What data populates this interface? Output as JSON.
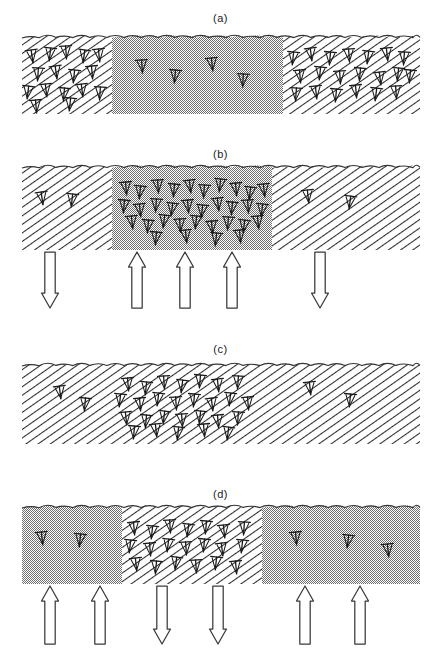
{
  "figure": {
    "width": 441,
    "height": 669,
    "caption": "",
    "colors": {
      "ink": "#1a1a1a",
      "hatch_line": "#2b2b2b",
      "stipple_gray": "#a8a8a8",
      "surface_line": "#333333",
      "arrow_outline": "#3a3a3a",
      "background": "#ffffff"
    }
  },
  "panels": [
    {
      "id": "a",
      "label": "(a)",
      "label_y": 12,
      "slab": {
        "x": 22,
        "y": 38,
        "width": 398,
        "height": 76
      },
      "regions": [
        {
          "name": "left-region",
          "fill": "hatch",
          "x0": 22,
          "x1": 112,
          "dislocation_density": "high"
        },
        {
          "name": "center-region",
          "fill": "stipple",
          "x0": 112,
          "x1": 283,
          "dislocation_density": "low"
        },
        {
          "name": "right-region",
          "fill": "hatch",
          "x0": 283,
          "x1": 420,
          "dislocation_density": "high"
        }
      ],
      "dislocations": [
        {
          "x": 32,
          "y": 56,
          "r": -8
        },
        {
          "x": 50,
          "y": 54,
          "r": 6
        },
        {
          "x": 66,
          "y": 52,
          "r": -4
        },
        {
          "x": 84,
          "y": 56,
          "r": 8
        },
        {
          "x": 99,
          "y": 55,
          "r": -6
        },
        {
          "x": 38,
          "y": 74,
          "r": 4
        },
        {
          "x": 56,
          "y": 72,
          "r": -8
        },
        {
          "x": 74,
          "y": 76,
          "r": 6
        },
        {
          "x": 92,
          "y": 72,
          "r": -5
        },
        {
          "x": 28,
          "y": 92,
          "r": 7
        },
        {
          "x": 46,
          "y": 90,
          "r": -6
        },
        {
          "x": 64,
          "y": 94,
          "r": 5
        },
        {
          "x": 82,
          "y": 90,
          "r": -7
        },
        {
          "x": 100,
          "y": 93,
          "r": 4
        },
        {
          "x": 36,
          "y": 106,
          "r": -5
        },
        {
          "x": 70,
          "y": 104,
          "r": 6
        },
        {
          "x": 142,
          "y": 66,
          "r": -4
        },
        {
          "x": 175,
          "y": 76,
          "r": 5
        },
        {
          "x": 212,
          "y": 64,
          "r": -6
        },
        {
          "x": 243,
          "y": 80,
          "r": 3
        },
        {
          "x": 293,
          "y": 58,
          "r": 6
        },
        {
          "x": 311,
          "y": 54,
          "r": -7
        },
        {
          "x": 330,
          "y": 58,
          "r": 5
        },
        {
          "x": 349,
          "y": 55,
          "r": -4
        },
        {
          "x": 368,
          "y": 57,
          "r": 7
        },
        {
          "x": 387,
          "y": 54,
          "r": -6
        },
        {
          "x": 404,
          "y": 58,
          "r": 4
        },
        {
          "x": 300,
          "y": 76,
          "r": -5
        },
        {
          "x": 320,
          "y": 73,
          "r": 6
        },
        {
          "x": 340,
          "y": 77,
          "r": -4
        },
        {
          "x": 360,
          "y": 74,
          "r": 5
        },
        {
          "x": 380,
          "y": 78,
          "r": -7
        },
        {
          "x": 398,
          "y": 74,
          "r": 6
        },
        {
          "x": 296,
          "y": 94,
          "r": 4
        },
        {
          "x": 316,
          "y": 92,
          "r": -6
        },
        {
          "x": 336,
          "y": 95,
          "r": 5
        },
        {
          "x": 356,
          "y": 91,
          "r": -5
        },
        {
          "x": 376,
          "y": 94,
          "r": 7
        },
        {
          "x": 396,
          "y": 92,
          "r": -4
        },
        {
          "x": 410,
          "y": 76,
          "r": 5
        }
      ],
      "arrows": []
    },
    {
      "id": "b",
      "label": "(b)",
      "label_y": 148,
      "slab": {
        "x": 22,
        "y": 168,
        "width": 398,
        "height": 82
      },
      "regions": [
        {
          "name": "left-region",
          "fill": "hatch",
          "x0": 22,
          "x1": 112,
          "dislocation_density": "low"
        },
        {
          "name": "center-region",
          "fill": "stipple",
          "x0": 112,
          "x1": 272,
          "dislocation_density": "very-high"
        },
        {
          "name": "right-region",
          "fill": "hatch",
          "x0": 272,
          "x1": 420,
          "dislocation_density": "low"
        }
      ],
      "dislocations": [
        {
          "x": 42,
          "y": 198,
          "r": -8
        },
        {
          "x": 72,
          "y": 200,
          "r": 6
        },
        {
          "x": 308,
          "y": 196,
          "r": -6
        },
        {
          "x": 350,
          "y": 202,
          "r": 7
        },
        {
          "x": 126,
          "y": 188,
          "r": -5
        },
        {
          "x": 140,
          "y": 192,
          "r": 6
        },
        {
          "x": 158,
          "y": 186,
          "r": -4
        },
        {
          "x": 174,
          "y": 190,
          "r": 5
        },
        {
          "x": 190,
          "y": 186,
          "r": -7
        },
        {
          "x": 204,
          "y": 191,
          "r": 4
        },
        {
          "x": 220,
          "y": 185,
          "r": 6
        },
        {
          "x": 236,
          "y": 189,
          "r": -5
        },
        {
          "x": 250,
          "y": 193,
          "r": 7
        },
        {
          "x": 264,
          "y": 190,
          "r": -6
        },
        {
          "x": 124,
          "y": 206,
          "r": 5
        },
        {
          "x": 140,
          "y": 210,
          "r": -6
        },
        {
          "x": 156,
          "y": 205,
          "r": 4
        },
        {
          "x": 172,
          "y": 209,
          "r": 7
        },
        {
          "x": 188,
          "y": 206,
          "r": -5
        },
        {
          "x": 202,
          "y": 211,
          "r": 6
        },
        {
          "x": 218,
          "y": 204,
          "r": -7
        },
        {
          "x": 232,
          "y": 208,
          "r": 5
        },
        {
          "x": 248,
          "y": 206,
          "r": -4
        },
        {
          "x": 262,
          "y": 210,
          "r": 6
        },
        {
          "x": 132,
          "y": 222,
          "r": -6
        },
        {
          "x": 148,
          "y": 226,
          "r": 5
        },
        {
          "x": 164,
          "y": 221,
          "r": 7
        },
        {
          "x": 180,
          "y": 225,
          "r": -4
        },
        {
          "x": 196,
          "y": 222,
          "r": 6
        },
        {
          "x": 212,
          "y": 227,
          "r": -5
        },
        {
          "x": 228,
          "y": 223,
          "r": 4
        },
        {
          "x": 244,
          "y": 226,
          "r": 7
        },
        {
          "x": 258,
          "y": 222,
          "r": -6
        },
        {
          "x": 156,
          "y": 238,
          "r": 5
        },
        {
          "x": 186,
          "y": 236,
          "r": -6
        },
        {
          "x": 216,
          "y": 239,
          "r": 6
        },
        {
          "x": 240,
          "y": 236,
          "r": -5
        }
      ],
      "arrows": [
        {
          "x": 50,
          "dir": "down"
        },
        {
          "x": 137,
          "dir": "up"
        },
        {
          "x": 185,
          "dir": "up"
        },
        {
          "x": 232,
          "dir": "up"
        },
        {
          "x": 320,
          "dir": "down"
        }
      ],
      "arrows_y": 252,
      "arrows_height": 56
    },
    {
      "id": "c",
      "label": "(c)",
      "label_y": 343,
      "slab": {
        "x": 22,
        "y": 366,
        "width": 398,
        "height": 78
      },
      "regions": [
        {
          "name": "full-region",
          "fill": "hatch",
          "x0": 22,
          "x1": 420,
          "dislocation_density": "mixed"
        }
      ],
      "dislocations": [
        {
          "x": 60,
          "y": 392,
          "r": -7
        },
        {
          "x": 85,
          "y": 404,
          "r": 5
        },
        {
          "x": 128,
          "y": 384,
          "r": -5
        },
        {
          "x": 146,
          "y": 388,
          "r": 6
        },
        {
          "x": 164,
          "y": 382,
          "r": -4
        },
        {
          "x": 182,
          "y": 386,
          "r": 7
        },
        {
          "x": 200,
          "y": 381,
          "r": 5
        },
        {
          "x": 218,
          "y": 385,
          "r": -6
        },
        {
          "x": 238,
          "y": 382,
          "r": 4
        },
        {
          "x": 120,
          "y": 400,
          "r": 6
        },
        {
          "x": 140,
          "y": 404,
          "r": -5
        },
        {
          "x": 158,
          "y": 399,
          "r": 7
        },
        {
          "x": 176,
          "y": 403,
          "r": -4
        },
        {
          "x": 194,
          "y": 400,
          "r": 5
        },
        {
          "x": 212,
          "y": 404,
          "r": -7
        },
        {
          "x": 230,
          "y": 399,
          "r": 6
        },
        {
          "x": 248,
          "y": 403,
          "r": -5
        },
        {
          "x": 126,
          "y": 418,
          "r": -6
        },
        {
          "x": 146,
          "y": 421,
          "r": 5
        },
        {
          "x": 164,
          "y": 417,
          "r": 7
        },
        {
          "x": 182,
          "y": 420,
          "r": -4
        },
        {
          "x": 200,
          "y": 417,
          "r": 6
        },
        {
          "x": 218,
          "y": 421,
          "r": -5
        },
        {
          "x": 238,
          "y": 418,
          "r": 4
        },
        {
          "x": 134,
          "y": 432,
          "r": 5
        },
        {
          "x": 156,
          "y": 430,
          "r": -6
        },
        {
          "x": 178,
          "y": 433,
          "r": 6
        },
        {
          "x": 204,
          "y": 430,
          "r": -5
        },
        {
          "x": 228,
          "y": 433,
          "r": 7
        },
        {
          "x": 310,
          "y": 388,
          "r": -6
        },
        {
          "x": 350,
          "y": 400,
          "r": 5
        }
      ],
      "arrows": []
    },
    {
      "id": "d",
      "label": "(d)",
      "label_y": 488,
      "slab": {
        "x": 22,
        "y": 508,
        "width": 398,
        "height": 76
      },
      "regions": [
        {
          "name": "left-region",
          "fill": "stipple",
          "x0": 22,
          "x1": 122,
          "dislocation_density": "low"
        },
        {
          "name": "center-region",
          "fill": "hatch",
          "x0": 122,
          "x1": 262,
          "dislocation_density": "very-high"
        },
        {
          "name": "right-region",
          "fill": "stipple",
          "x0": 262,
          "x1": 420,
          "dislocation_density": "low"
        }
      ],
      "dislocations": [
        {
          "x": 42,
          "y": 538,
          "r": -6
        },
        {
          "x": 80,
          "y": 540,
          "r": 6
        },
        {
          "x": 296,
          "y": 538,
          "r": -5
        },
        {
          "x": 348,
          "y": 541,
          "r": 7
        },
        {
          "x": 388,
          "y": 550,
          "r": -6
        },
        {
          "x": 134,
          "y": 528,
          "r": -5
        },
        {
          "x": 152,
          "y": 532,
          "r": 6
        },
        {
          "x": 170,
          "y": 526,
          "r": -4
        },
        {
          "x": 188,
          "y": 530,
          "r": 7
        },
        {
          "x": 206,
          "y": 527,
          "r": 5
        },
        {
          "x": 224,
          "y": 531,
          "r": -6
        },
        {
          "x": 244,
          "y": 528,
          "r": 4
        },
        {
          "x": 130,
          "y": 546,
          "r": 6
        },
        {
          "x": 150,
          "y": 549,
          "r": -5
        },
        {
          "x": 168,
          "y": 545,
          "r": 7
        },
        {
          "x": 186,
          "y": 548,
          "r": -4
        },
        {
          "x": 204,
          "y": 545,
          "r": 5
        },
        {
          "x": 222,
          "y": 549,
          "r": -7
        },
        {
          "x": 242,
          "y": 546,
          "r": 6
        },
        {
          "x": 136,
          "y": 564,
          "r": -6
        },
        {
          "x": 156,
          "y": 567,
          "r": 5
        },
        {
          "x": 176,
          "y": 563,
          "r": 7
        },
        {
          "x": 196,
          "y": 566,
          "r": -4
        },
        {
          "x": 216,
          "y": 563,
          "r": 6
        },
        {
          "x": 236,
          "y": 567,
          "r": -5
        }
      ],
      "arrows": [
        {
          "x": 50,
          "dir": "up"
        },
        {
          "x": 100,
          "dir": "up"
        },
        {
          "x": 162,
          "dir": "down"
        },
        {
          "x": 218,
          "dir": "down"
        },
        {
          "x": 305,
          "dir": "up"
        },
        {
          "x": 360,
          "dir": "up"
        }
      ],
      "arrows_y": 586,
      "arrows_height": 58
    }
  ]
}
